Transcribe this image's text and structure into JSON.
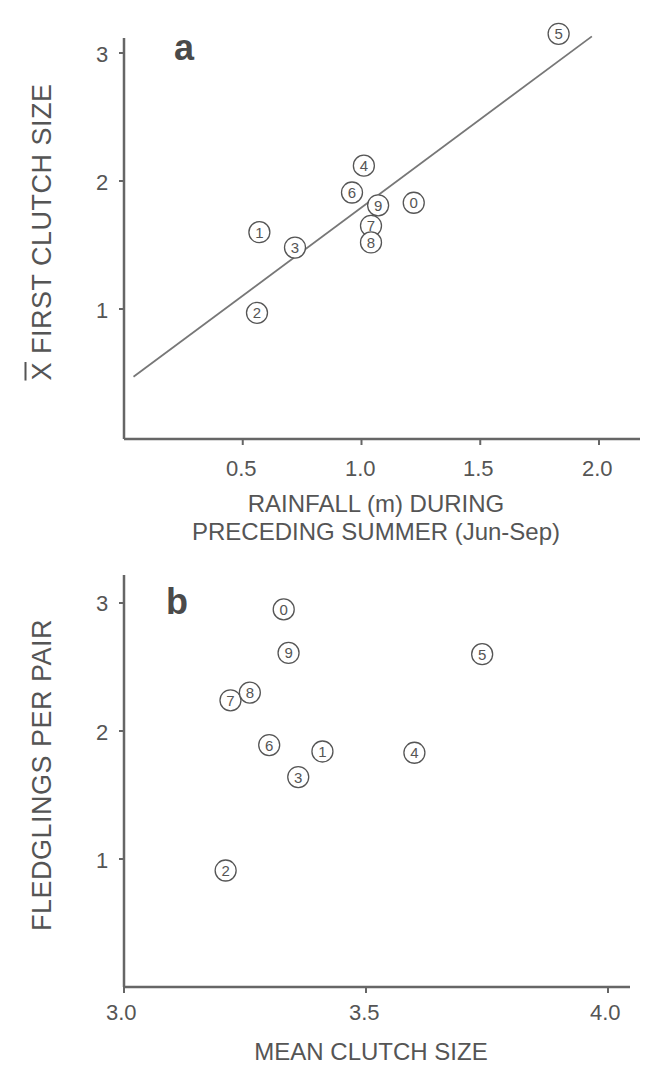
{
  "colors": {
    "ink": "#555555",
    "axis": "#666666",
    "background": "#ffffff"
  },
  "panel_a": {
    "letter": "a",
    "ylabel_prefix": "X",
    "ylabel_rest": " FIRST CLUTCH SIZE",
    "xlabel_line1": "RAINFALL (m) DURING",
    "xlabel_line2": "PRECEDING SUMMER (Jun-Sep)",
    "yticks": [
      "1",
      "2",
      "3"
    ],
    "xticks": [
      "0.5",
      "1.0",
      "1.5",
      "2.0"
    ]
  },
  "panel_b": {
    "letter": "b",
    "ylabel": "FLEDGLINGS PER PAIR",
    "xlabel": "MEAN CLUTCH SIZE",
    "yticks": [
      "1",
      "2",
      "3"
    ],
    "xticks": [
      "3.0",
      "3.5",
      "4.0"
    ]
  },
  "chart_data": [
    {
      "type": "scatter",
      "panel": "a",
      "title": "a",
      "xlabel": "RAINFALL (m) DURING PRECEDING SUMMER (Jun-Sep)",
      "ylabel": "X̄ FIRST CLUTCH SIZE",
      "xlim": [
        0,
        2.2
      ],
      "ylim": [
        0,
        3.2
      ],
      "xticks": [
        0.5,
        1.0,
        1.5,
        2.0
      ],
      "yticks": [
        1,
        2,
        3
      ],
      "grid": false,
      "legend": null,
      "points": [
        {
          "label": "0",
          "x": 1.22,
          "y": 1.83
        },
        {
          "label": "1",
          "x": 0.57,
          "y": 1.6
        },
        {
          "label": "2",
          "x": 0.56,
          "y": 0.97
        },
        {
          "label": "3",
          "x": 0.72,
          "y": 1.48
        },
        {
          "label": "4",
          "x": 1.01,
          "y": 2.12
        },
        {
          "label": "5",
          "x": 1.83,
          "y": 3.15
        },
        {
          "label": "6",
          "x": 0.96,
          "y": 1.91
        },
        {
          "label": "7",
          "x": 1.04,
          "y": 1.65
        },
        {
          "label": "8",
          "x": 1.04,
          "y": 1.52
        },
        {
          "label": "9",
          "x": 1.07,
          "y": 1.81
        }
      ],
      "regression_line": {
        "x": [
          0.04,
          1.97
        ],
        "y": [
          0.47,
          3.13
        ]
      }
    },
    {
      "type": "scatter",
      "panel": "b",
      "title": "b",
      "xlabel": "MEAN CLUTCH SIZE",
      "ylabel": "FLEDGLINGS PER PAIR",
      "xlim": [
        3.0,
        4.05
      ],
      "ylim": [
        0,
        3.2
      ],
      "xticks": [
        3.0,
        3.5,
        4.0
      ],
      "yticks": [
        1,
        2,
        3
      ],
      "grid": false,
      "legend": null,
      "points": [
        {
          "label": "0",
          "x": 3.33,
          "y": 2.95
        },
        {
          "label": "1",
          "x": 3.41,
          "y": 1.84
        },
        {
          "label": "2",
          "x": 3.21,
          "y": 0.91
        },
        {
          "label": "3",
          "x": 3.36,
          "y": 1.64
        },
        {
          "label": "4",
          "x": 3.6,
          "y": 1.83
        },
        {
          "label": "5",
          "x": 3.74,
          "y": 2.6
        },
        {
          "label": "6",
          "x": 3.3,
          "y": 1.89
        },
        {
          "label": "7",
          "x": 3.22,
          "y": 2.24
        },
        {
          "label": "8",
          "x": 3.26,
          "y": 2.3
        },
        {
          "label": "9",
          "x": 3.34,
          "y": 2.61
        }
      ]
    }
  ]
}
